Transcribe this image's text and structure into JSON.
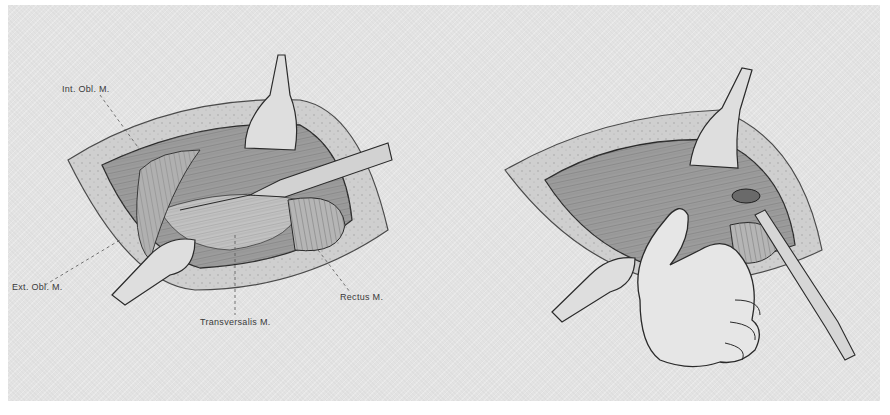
{
  "figure": {
    "left_panel": {
      "labels": {
        "int_obl": "Int. Obl. M.",
        "ext_obl": "Ext. Obl. M.",
        "transversalis": "Transversalis M.",
        "rectus": "Rectus M."
      }
    },
    "right_panel": {
      "labels": {}
    }
  },
  "colors": {
    "background": "#e3e3e3",
    "ink": "#2a2a2a",
    "tissue": "#b8b8b8",
    "retractor": "#dcdcdc"
  }
}
